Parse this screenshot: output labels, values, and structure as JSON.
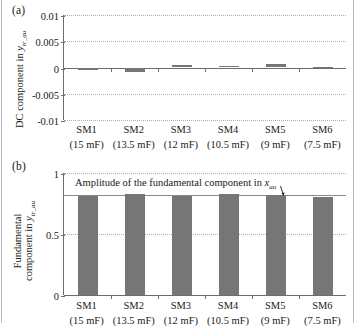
{
  "figure": {
    "panel_a_tag": "(a)",
    "panel_b_tag": "(b)"
  },
  "chart_data": [
    {
      "type": "bar",
      "panel": "(a)",
      "title": "",
      "xlabel": "",
      "ylabel": "DC component in y_tr_au",
      "ylabel_main": "DC component in ",
      "ylabel_var": "y",
      "ylabel_sub": "tr_au",
      "categories": [
        "SM1",
        "SM2",
        "SM3",
        "SM4",
        "SM5",
        "SM6"
      ],
      "category_subs": [
        "(15 mF)",
        "(13.5 mF)",
        "(12 mF)",
        "(10.5 mF)",
        "(9 mF)",
        "(7.5 mF)"
      ],
      "values": [
        -0.00055,
        -0.00085,
        0.0004,
        0.00022,
        0.0007,
        4e-05
      ],
      "ylim": [
        -0.01,
        0.01
      ],
      "yticks": [
        0.01,
        0.005,
        0,
        -0.005,
        -0.01
      ],
      "ytick_labels": [
        "0.01",
        "0.005",
        "0",
        "-0.005",
        "-0.01"
      ],
      "grid": true,
      "bar_color": "#767676"
    },
    {
      "type": "bar",
      "panel": "(b)",
      "title": "",
      "xlabel": "",
      "ylabel": "Fundamental component in y_tr_au",
      "ylabel_line1": "Fundamental",
      "ylabel_line2_main": "component in ",
      "ylabel_var": "y",
      "ylabel_sub": "tr_au",
      "categories": [
        "SM1",
        "SM2",
        "SM3",
        "SM4",
        "SM5",
        "SM6"
      ],
      "category_subs": [
        "(15 mF)",
        "(13.5 mF)",
        "(12 mF)",
        "(10.5 mF)",
        "(9 mF)",
        "(7.5 mF)"
      ],
      "values": [
        0.815,
        0.825,
        0.815,
        0.827,
        0.82,
        0.805
      ],
      "ylim": [
        0,
        1
      ],
      "yticks": [
        1,
        0.5,
        0
      ],
      "ytick_labels": [
        "1",
        "0.5",
        "0"
      ],
      "grid": true,
      "bar_color": "#767676",
      "reference_line": {
        "value": 0.82,
        "label_main": "Amplitude of the fundamental component in ",
        "label_var": "x",
        "label_sub": "au"
      }
    }
  ]
}
